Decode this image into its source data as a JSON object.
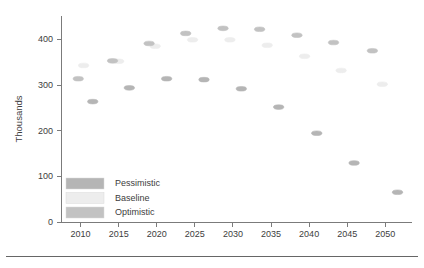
{
  "chart_data": {
    "type": "scatter",
    "title": "",
    "xlabel": "",
    "ylabel": "Thousands",
    "xlim": [
      2007.5,
      2053.5
    ],
    "ylim": [
      0,
      450
    ],
    "yticks": [
      0,
      100,
      200,
      300,
      400
    ],
    "xticks": [
      2010,
      2015,
      2020,
      2025,
      2030,
      2035,
      2040,
      2045,
      2050
    ],
    "grid": false,
    "legend_position": "bottom-left",
    "marker_shape": "ellipse",
    "series": [
      {
        "name": "Pessimistic",
        "color": "#b5b5b5",
        "x": [
          2011.6,
          2016.4,
          2021.3,
          2026.2,
          2031.1,
          2036.0,
          2041.0,
          2045.9,
          2051.6
        ],
        "values": [
          263,
          293,
          313,
          311,
          291,
          251,
          194,
          129,
          65
        ]
      },
      {
        "name": "Baseline",
        "color": "#ededed",
        "x": [
          2010.4,
          2015.0,
          2019.8,
          2024.7,
          2029.6,
          2034.5,
          2039.4,
          2044.2,
          2049.6
        ],
        "values": [
          342,
          351,
          384,
          398,
          398,
          386,
          362,
          331,
          301
        ]
      },
      {
        "name": "Optimistic",
        "color": "#c2c2c2",
        "x": [
          2009.7,
          2014.2,
          2019.0,
          2023.8,
          2028.7,
          2033.5,
          2038.4,
          2043.2,
          2048.3
        ],
        "values": [
          313,
          352,
          390,
          412,
          423,
          421,
          408,
          392,
          374
        ]
      }
    ]
  },
  "axis": {
    "ylabel": "Thousands",
    "ytick_labels": [
      "0",
      "100",
      "200",
      "300",
      "400"
    ],
    "xtick_labels": [
      "2010",
      "2015",
      "2020",
      "2025",
      "2030",
      "2035",
      "2040",
      "2045",
      "2050"
    ]
  },
  "legend": {
    "entries": [
      {
        "label": "Pessimistic",
        "color": "#b5b5b5"
      },
      {
        "label": "Baseline",
        "color": "#ededed"
      },
      {
        "label": "Optimistic",
        "color": "#c2c2c2"
      }
    ]
  },
  "colors": {
    "axis": "#7b7b7b",
    "text": "#3d3d3d",
    "background": "#ffffff",
    "footer_rule": "#666666"
  }
}
